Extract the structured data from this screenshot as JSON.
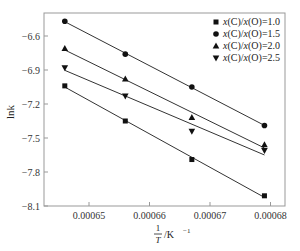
{
  "chart_data": {
    "type": "scatter",
    "title": "",
    "xlabel": "1/T /K^-1",
    "ylabel": "lnk",
    "xlim": [
      0.000641,
      0.000682
    ],
    "ylim": [
      -8.1,
      -6.39
    ],
    "x_ticks": [
      "0.00065",
      "0.00066",
      "0.00067",
      "0.00068"
    ],
    "y_ticks": [
      "-6.6",
      "-6.9",
      "-7.2",
      "-7.5",
      "-7.8",
      "-8.1"
    ],
    "grid": false,
    "legend_position": "upper right",
    "x": [
      0.000646,
      0.000656,
      0.000667,
      0.000679
    ],
    "series": [
      {
        "name": "x(C)/x(O)=1.0",
        "marker": "square",
        "values": [
          -7.04,
          -7.35,
          -7.69,
          -8.01
        ]
      },
      {
        "name": "x(C)/x(O)=1.5",
        "marker": "circle",
        "values": [
          -6.47,
          -6.76,
          -7.05,
          -7.39
        ]
      },
      {
        "name": "x(C)/x(O)=2.0",
        "marker": "triangle-up",
        "values": [
          -6.71,
          -6.98,
          -7.32,
          -7.56
        ]
      },
      {
        "name": "x(C)/x(O)=2.5",
        "marker": "triangle-down",
        "values": [
          -6.88,
          -7.13,
          -7.44,
          -7.61
        ]
      }
    ],
    "fit_lines": true
  },
  "axes": {
    "ylabel": "lnk",
    "xlabel_num": "1",
    "xlabel_den": "T",
    "xlabel_unit": "/K",
    "xlabel_exp": "−1"
  },
  "legend": [
    {
      "label": "x(C)/x(O)=1.0"
    },
    {
      "label": "x(C)/x(O)=1.5"
    },
    {
      "label": "x(C)/x(O)=2.0"
    },
    {
      "label": "x(C)/x(O)=2.5"
    }
  ]
}
